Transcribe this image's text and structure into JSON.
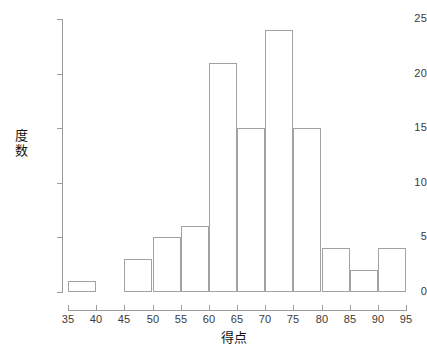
{
  "chart_data": {
    "type": "bar",
    "subtype": "histogram",
    "title": "",
    "xlabel": "得点",
    "ylabel": "度数",
    "bin_width": 5,
    "bin_edges": [
      35,
      40,
      45,
      50,
      55,
      60,
      65,
      70,
      75,
      80,
      85,
      90,
      95
    ],
    "categories": [
      "35-40",
      "40-45",
      "45-50",
      "50-55",
      "55-60",
      "60-65",
      "65-70",
      "70-75",
      "75-80",
      "80-85",
      "85-90",
      "90-95"
    ],
    "values": [
      1,
      0,
      3,
      5,
      6,
      21,
      15,
      24,
      15,
      4,
      2,
      4
    ],
    "bins": [
      {
        "start": 35,
        "end": 40,
        "value": 1
      },
      {
        "start": 40,
        "end": 45,
        "value": 0
      },
      {
        "start": 45,
        "end": 50,
        "value": 3
      },
      {
        "start": 50,
        "end": 55,
        "value": 5
      },
      {
        "start": 55,
        "end": 60,
        "value": 6
      },
      {
        "start": 60,
        "end": 65,
        "value": 21
      },
      {
        "start": 65,
        "end": 70,
        "value": 15
      },
      {
        "start": 70,
        "end": 75,
        "value": 24
      },
      {
        "start": 75,
        "end": 80,
        "value": 15
      },
      {
        "start": 80,
        "end": 85,
        "value": 4
      },
      {
        "start": 85,
        "end": 90,
        "value": 2
      },
      {
        "start": 90,
        "end": 95,
        "value": 4
      }
    ],
    "xlim": [
      35,
      95
    ],
    "ylim": [
      0,
      25
    ],
    "xticks": [
      35,
      40,
      45,
      50,
      55,
      60,
      65,
      70,
      75,
      80,
      85,
      90,
      95
    ],
    "yticks": [
      0,
      5,
      10,
      15,
      20,
      25
    ],
    "xtick_labels": [
      "35",
      "40",
      "45",
      "50",
      "55",
      "60",
      "65",
      "70",
      "75",
      "80",
      "85",
      "90",
      "95"
    ],
    "ytick_labels": [
      "0",
      "5",
      "10",
      "15",
      "20",
      "25"
    ],
    "ylabel_chars": [
      "度",
      "数"
    ],
    "grid": false,
    "legend": false,
    "bar_fill_color": "#ffffff",
    "bar_border_color": "#a2a2a2",
    "axis_color": "#9b9b9b",
    "text_color": "#3a3a3a",
    "background_color": "#ffffff"
  }
}
